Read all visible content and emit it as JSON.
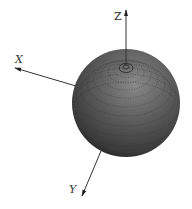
{
  "diagram": {
    "type": "3d-sphere-with-axes",
    "sphere": {
      "center": [
        126,
        103
      ],
      "radius": 54,
      "base_color": "#555555",
      "highlight_color": "#8a8a8a",
      "shadow_color": "#1e1e1e",
      "pole_rings_center": [
        126,
        67
      ]
    },
    "axes": {
      "x": {
        "label": "X",
        "color": "#333333"
      },
      "y": {
        "label": "Y",
        "color": "#333333"
      },
      "z": {
        "label": "Z",
        "color": "#333333"
      }
    }
  }
}
